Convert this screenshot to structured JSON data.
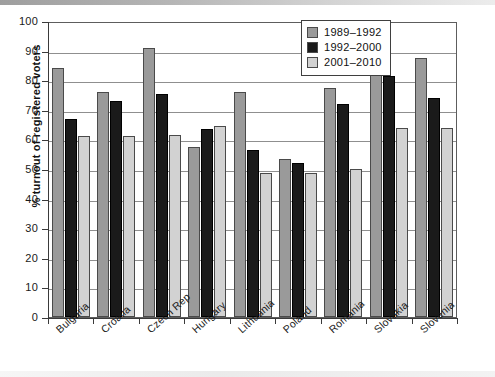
{
  "chart_data": {
    "type": "bar",
    "title": "",
    "xlabel": "",
    "ylabel": "% turnout of registered voters",
    "ylim": [
      0,
      100
    ],
    "yticks": [
      0,
      10,
      20,
      30,
      40,
      50,
      60,
      70,
      80,
      90,
      100
    ],
    "ytick_labels": [
      "0",
      "10",
      "20",
      "30",
      "40",
      "50",
      "60",
      "70",
      "80",
      "90",
      "100"
    ],
    "grid": true,
    "legend_position": "top-right",
    "categories": [
      "Bulgaria",
      "Croatia",
      "Czech Rep",
      "Hungary",
      "Lithuania",
      "Poland",
      "Romania",
      "Slovakia",
      "Slovenia"
    ],
    "series": [
      {
        "name": "1989–1992",
        "color": "#9a9a9a",
        "values": [
          84,
          76,
          91,
          57.5,
          76,
          53.5,
          77.5,
          92,
          87.5
        ]
      },
      {
        "name": "1992–2000",
        "color": "#1a1a1a",
        "values": [
          67,
          73,
          75.5,
          63.5,
          56.5,
          52,
          72,
          81.5,
          74
        ]
      },
      {
        "name": "2001–2010",
        "color": "#d2d2d2",
        "values": [
          61,
          61,
          61.5,
          64.5,
          48.5,
          48.5,
          50,
          64,
          64
        ]
      }
    ]
  }
}
